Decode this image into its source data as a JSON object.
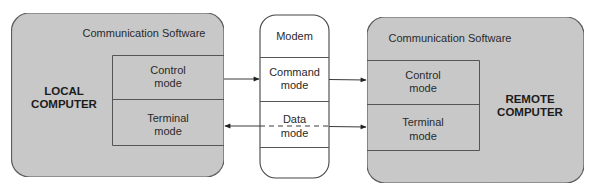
{
  "colors": {
    "computer_fill": "#c9c9c9",
    "computer_stroke": "#555555",
    "modem_fill": "#ffffff",
    "line": "#3a3a3a",
    "text": "#2a2a2a"
  },
  "local_computer": {
    "label_line1": "LOCAL",
    "label_line2": "COMPUTER",
    "software_title": "Communication Software",
    "modes": [
      {
        "line1": "Control",
        "line2": "mode"
      },
      {
        "line1": "Terminal",
        "line2": "mode"
      }
    ]
  },
  "modem": {
    "title": "Modem",
    "modes": [
      {
        "line1": "Command",
        "line2": "mode"
      },
      {
        "line1": "Data",
        "line2": "mode"
      }
    ]
  },
  "remote_computer": {
    "label_line1": "REMOTE",
    "label_line2": "COMPUTER",
    "software_title": "Communication Software",
    "modes": [
      {
        "line1": "Control",
        "line2": "mode"
      },
      {
        "line1": "Terminal",
        "line2": "mode"
      }
    ]
  },
  "connections": [
    {
      "from": "local.control_mode",
      "to": "modem.command_mode",
      "style": "solid",
      "direction": "right"
    },
    {
      "from": "modem.command_mode",
      "to": "remote.control_mode",
      "style": "solid",
      "direction": "right"
    },
    {
      "from": "modem.data_mode",
      "to": "local.terminal_mode",
      "style": "solid",
      "direction": "left"
    },
    {
      "from": "modem.data_mode",
      "to": "remote.terminal_mode",
      "style": "solid",
      "direction": "right"
    },
    {
      "from": "modem.data_mode",
      "to": "modem.data_mode",
      "style": "dashed",
      "direction": "through"
    }
  ]
}
